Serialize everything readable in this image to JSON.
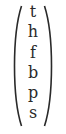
{
  "vector": {
    "delimiter": "parentheses",
    "entries": [
      "t",
      "h",
      "f",
      "b",
      "p",
      "s"
    ]
  },
  "colors": {
    "text": "#2a2a2a",
    "background": "#ffffff"
  }
}
